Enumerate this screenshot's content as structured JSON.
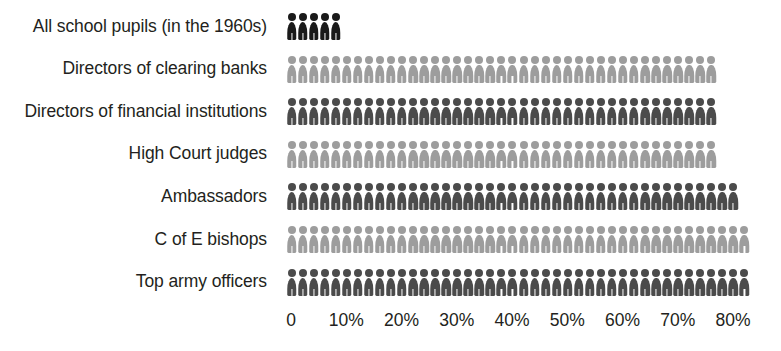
{
  "chart_data": {
    "type": "bar",
    "subtype": "pictogram-isotype",
    "title": "",
    "subtitle": "",
    "xlabel": "",
    "ylabel": "",
    "xlim": [
      0,
      90
    ],
    "grid": false,
    "legend": null,
    "unit_note": "each figure icon represents 2%",
    "icon_value_percent": 2,
    "categories": [
      "All school pupils (in the 1960s)",
      "Directors of clearing banks",
      "Directors of financial institutions",
      "High Court judges",
      "Ambassadors",
      "C of E bishops",
      "Top army officers"
    ],
    "values": [
      10,
      78,
      78,
      78,
      83,
      85,
      85
    ],
    "icon_counts": [
      5,
      39,
      39,
      39,
      41,
      42,
      42
    ],
    "tick_labels": [
      "0",
      "10%",
      "20%",
      "30%",
      "40%",
      "50%",
      "60%",
      "70%",
      "80%"
    ],
    "tick_values": [
      0,
      10,
      20,
      30,
      40,
      50,
      60,
      70,
      80
    ],
    "series": [
      {
        "name": "Share",
        "values": [
          10,
          78,
          78,
          78,
          83,
          85,
          85
        ]
      }
    ],
    "rows": [
      {
        "label": "All school pupils (in the 1960s)",
        "value": 10,
        "icons": 5,
        "color": "#1a1a1a"
      },
      {
        "label": "Directors of clearing banks",
        "value": 78,
        "icons": 39,
        "color": "#9d9d9d"
      },
      {
        "label": "Directors of financial institutions",
        "value": 78,
        "icons": 39,
        "color": "#4b4b4b"
      },
      {
        "label": "High Court judges",
        "value": 78,
        "icons": 39,
        "color": "#9d9d9d"
      },
      {
        "label": "Ambassadors",
        "value": 83,
        "icons": 41,
        "color": "#4b4b4b"
      },
      {
        "label": "C of E bishops",
        "value": 85,
        "icons": 42,
        "color": "#9d9d9d"
      },
      {
        "label": "Top army officers",
        "value": 85,
        "icons": 42,
        "color": "#4b4b4b"
      }
    ],
    "colors": {
      "dark": "#1a1a1a",
      "mid_dark": "#4b4b4b",
      "light": "#9d9d9d",
      "text": "#231f20",
      "background": "#ffffff"
    }
  }
}
